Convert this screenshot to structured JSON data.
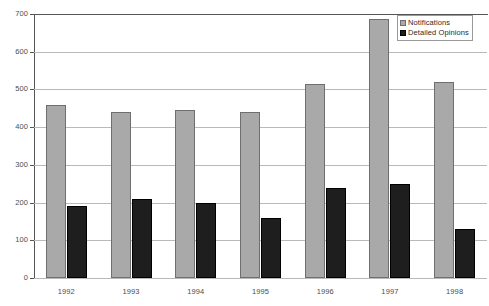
{
  "chart_data": {
    "type": "bar",
    "title": "",
    "subtitle": "",
    "xlabel": "",
    "ylabel": "",
    "categories": [
      "1992",
      "1993",
      "1994",
      "1995",
      "1996",
      "1997",
      "1998"
    ],
    "series": [
      {
        "name": "Notifications",
        "color": "#a9a9a9",
        "values": [
          460,
          440,
          445,
          440,
          515,
          688,
          520
        ]
      },
      {
        "name": "Detailed Opinions",
        "color": "#1e1e1e",
        "values": [
          190,
          210,
          200,
          160,
          240,
          250,
          130
        ]
      }
    ],
    "ylim": [
      0,
      700
    ],
    "yticks": [
      0,
      100,
      200,
      300,
      400,
      500,
      600,
      700
    ],
    "ytick_labels": [
      "0",
      "100",
      "200",
      "300",
      "400",
      "500",
      "600",
      "700"
    ],
    "grid": true,
    "grid_axis": "y",
    "legend": {
      "position": "top-right",
      "entries": [
        "Notifications",
        "Detailed Opinions"
      ]
    },
    "colors": {
      "notifications": "#a9a9a9",
      "detailed_opinions": "#1e1e1e",
      "gridline": "#b9b9b9",
      "axis": "#555555",
      "tick_text": "#4d4d4d"
    }
  }
}
